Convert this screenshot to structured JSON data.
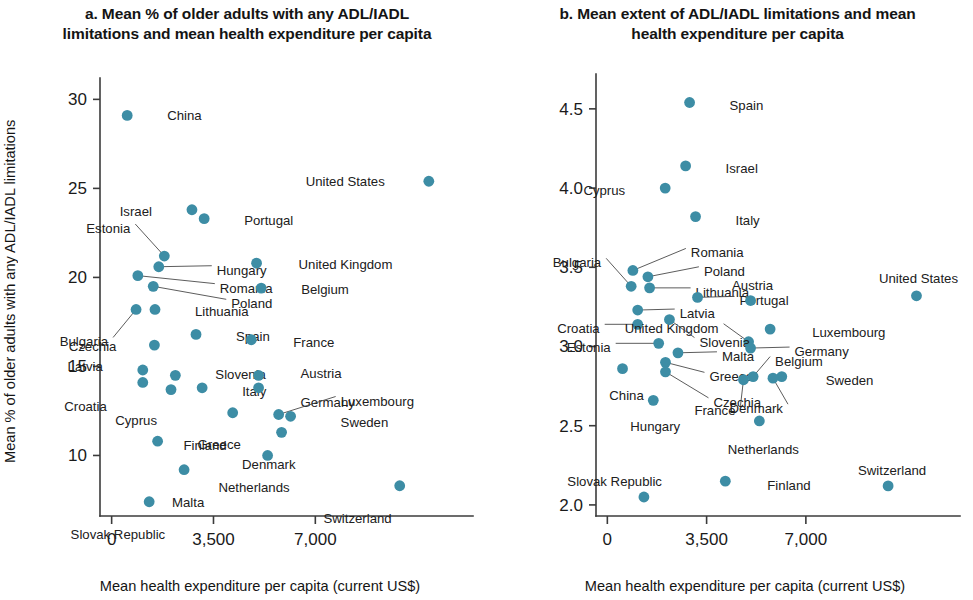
{
  "figure": {
    "background": "#ffffff",
    "marker_color": "#3d8da5",
    "axis_color": "#3b3b3b",
    "text_color": "#1a1a1a"
  },
  "panel_a": {
    "title": "a. Mean % of older adults with any ADL/IADL limitations and mean health expenditure per capita",
    "xlabel": "Mean health expenditure per capita (current US$)",
    "ylabel": "Mean % of older adults with any ADL/IADL limitations"
  },
  "panel_b": {
    "title": "b. Mean extent of ADL/IADL limitations and mean health expenditure per capita",
    "xlabel": "Mean health expenditure per capita (current US$)",
    "ylabel": "Mean extent of ADL/IADL limitations"
  },
  "chart_data": [
    {
      "type": "scatter",
      "panel": "a",
      "title": "a. Mean % of older adults with any ADL/IADL limitations and mean health expenditure per capita",
      "xlabel": "Mean health expenditure per capita (current US$)",
      "ylabel": "Mean % of older adults with any ADL/IADL limitations",
      "xlim": [
        -400,
        11800
      ],
      "ylim": [
        6.6,
        31.2
      ],
      "xticks": [
        0,
        3500,
        7000
      ],
      "xticklabels": [
        "0",
        "3,500",
        "7,000"
      ],
      "yticks": [
        10,
        15,
        20,
        25,
        30
      ],
      "yticklabels": [
        "10",
        "15",
        "20",
        "25",
        "30"
      ],
      "grid": false,
      "legend": "none",
      "points": [
        {
          "label": "China",
          "x": 535,
          "y": 29.1,
          "lx": 40,
          "ly": 0,
          "anchor": "start"
        },
        {
          "label": "United States",
          "x": 10900,
          "y": 25.4,
          "lx": -44,
          "ly": 0,
          "anchor": "end"
        },
        {
          "label": "Israel",
          "x": 2760,
          "y": 23.8,
          "lx": -40,
          "ly": 1,
          "anchor": "end"
        },
        {
          "label": "Portugal",
          "x": 3180,
          "y": 23.3,
          "lx": 40,
          "ly": 1,
          "anchor": "start"
        },
        {
          "label": "Estonia",
          "x": 1810,
          "y": 21.2,
          "lx": -34,
          "ly": -28,
          "anchor": "end",
          "leader": true
        },
        {
          "label": "Hungary",
          "x": 1620,
          "y": 20.6,
          "lx": 58,
          "ly": 3,
          "anchor": "start",
          "leader": true
        },
        {
          "label": "Romania",
          "x": 900,
          "y": 20.1,
          "lx": 82,
          "ly": 12,
          "anchor": "start",
          "leader": true
        },
        {
          "label": "Poland",
          "x": 1430,
          "y": 19.5,
          "lx": 78,
          "ly": 17,
          "anchor": "start",
          "leader": true
        },
        {
          "label": "United Kingdom",
          "x": 4980,
          "y": 20.8,
          "lx": 42,
          "ly": 1,
          "anchor": "start"
        },
        {
          "label": "Belgium",
          "x": 5140,
          "y": 19.4,
          "lx": 40,
          "ly": 1,
          "anchor": "start"
        },
        {
          "label": "Lithuania",
          "x": 1490,
          "y": 18.2,
          "lx": 40,
          "ly": 2,
          "anchor": "start"
        },
        {
          "label": "Bulgaria",
          "x": 840,
          "y": 18.2,
          "lx": -28,
          "ly": 32,
          "anchor": "end",
          "leader": true
        },
        {
          "label": "Czechia",
          "x": 1470,
          "y": 16.2,
          "lx": -38,
          "ly": 1,
          "anchor": "end"
        },
        {
          "label": "Spain",
          "x": 2900,
          "y": 16.8,
          "lx": 40,
          "ly": 2,
          "anchor": "start"
        },
        {
          "label": "France",
          "x": 4800,
          "y": 16.5,
          "lx": 42,
          "ly": 2,
          "anchor": "start"
        },
        {
          "label": "Latvia",
          "x": 1070,
          "y": 14.8,
          "lx": -40,
          "ly": -4,
          "anchor": "end"
        },
        {
          "label": "Croatia",
          "x": 1070,
          "y": 14.1,
          "lx": -36,
          "ly": 24,
          "anchor": "end"
        },
        {
          "label": "Slovenia",
          "x": 2190,
          "y": 14.5,
          "lx": 40,
          "ly": -1,
          "anchor": "start"
        },
        {
          "label": "Cyprus",
          "x": 2040,
          "y": 13.7,
          "lx": -14,
          "ly": 30,
          "anchor": "end"
        },
        {
          "label": "Italy",
          "x": 3110,
          "y": 13.8,
          "lx": 40,
          "ly": 3,
          "anchor": "start"
        },
        {
          "label": "Austria",
          "x": 5050,
          "y": 14.5,
          "lx": 42,
          "ly": -2,
          "anchor": "start"
        },
        {
          "label": "Germany",
          "x": 5050,
          "y": 13.8,
          "lx": 42,
          "ly": 14,
          "anchor": "start"
        },
        {
          "label": "Luxembourg",
          "x": 5740,
          "y": 12.3,
          "lx": 62,
          "ly": -14,
          "anchor": "start",
          "leader": true
        },
        {
          "label": "Sweden",
          "x": 6150,
          "y": 12.2,
          "lx": 50,
          "ly": 6,
          "anchor": "start"
        },
        {
          "label": "Finland",
          "x": 4160,
          "y": 12.4,
          "lx": -6,
          "ly": 32,
          "anchor": "end"
        },
        {
          "label": "Denmark",
          "x": 5840,
          "y": 11.3,
          "lx": 14,
          "ly": 32,
          "anchor": "end"
        },
        {
          "label": "Greece",
          "x": 1580,
          "y": 10.8,
          "lx": 40,
          "ly": 3,
          "anchor": "start"
        },
        {
          "label": "Netherlands",
          "x": 5360,
          "y": 10.0,
          "lx": 22,
          "ly": 32,
          "anchor": "end"
        },
        {
          "label": "Malta",
          "x": 2490,
          "y": 9.2,
          "lx": 4,
          "ly": 32,
          "anchor": "middle"
        },
        {
          "label": "Switzerland",
          "x": 9900,
          "y": 8.3,
          "lx": -8,
          "ly": 32,
          "anchor": "end"
        },
        {
          "label": "Slovak Republic",
          "x": 1290,
          "y": 7.4,
          "lx": 16,
          "ly": 32,
          "anchor": "end"
        }
      ]
    },
    {
      "type": "scatter",
      "panel": "b",
      "title": "b. Mean extent of ADL/IADL limitations and mean health expenditure per capita",
      "xlabel": "Mean health expenditure per capita (current US$)",
      "ylabel": "Mean extent of ADL/IADL limitations",
      "xlim": [
        -400,
        11800
      ],
      "ylim": [
        1.93,
        4.72
      ],
      "xticks": [
        0,
        3500,
        7000
      ],
      "xticklabels": [
        "0",
        "3,500",
        "7,000"
      ],
      "yticks": [
        2.0,
        2.5,
        3.0,
        3.5,
        4.0,
        4.5
      ],
      "yticklabels": [
        "2.0",
        "2.5",
        "3.0",
        "3.5",
        "4.0",
        "4.5"
      ],
      "grid": false,
      "legend": "none",
      "points": [
        {
          "label": "Spain",
          "x": 2900,
          "y": 4.54,
          "lx": 40,
          "ly": 2,
          "anchor": "start"
        },
        {
          "label": "Israel",
          "x": 2760,
          "y": 4.14,
          "lx": 40,
          "ly": 2,
          "anchor": "start"
        },
        {
          "label": "Cyprus",
          "x": 2040,
          "y": 4.0,
          "lx": -40,
          "ly": 2,
          "anchor": "end"
        },
        {
          "label": "Italy",
          "x": 3110,
          "y": 3.82,
          "lx": 40,
          "ly": 3,
          "anchor": "start"
        },
        {
          "label": "Bulgaria",
          "x": 840,
          "y": 3.38,
          "lx": -30,
          "ly": -24,
          "anchor": "end",
          "leader": true
        },
        {
          "label": "Romania",
          "x": 900,
          "y": 3.48,
          "lx": 58,
          "ly": -18,
          "anchor": "start",
          "leader": true
        },
        {
          "label": "Poland",
          "x": 1430,
          "y": 3.44,
          "lx": 56,
          "ly": -6,
          "anchor": "start",
          "leader": true
        },
        {
          "label": "Lithuania",
          "x": 1490,
          "y": 3.37,
          "lx": 46,
          "ly": 4,
          "anchor": "start",
          "leader": true
        },
        {
          "label": "Portugal",
          "x": 3180,
          "y": 3.31,
          "lx": 42,
          "ly": 3,
          "anchor": "start",
          "leader": true
        },
        {
          "label": "Latvia",
          "x": 1070,
          "y": 3.23,
          "lx": 42,
          "ly": 3,
          "anchor": "start",
          "leader": true
        },
        {
          "label": "Austria",
          "x": 5050,
          "y": 3.29,
          "lx": 2,
          "ly": -16,
          "anchor": "middle"
        },
        {
          "label": "United States",
          "x": 10900,
          "y": 3.32,
          "lx": 2,
          "ly": -18,
          "anchor": "middle"
        },
        {
          "label": "Croatia",
          "x": 1070,
          "y": 3.14,
          "lx": -38,
          "ly": 4,
          "anchor": "end",
          "leader": true
        },
        {
          "label": "United Kingdom",
          "x": 4980,
          "y": 3.03,
          "lx": -30,
          "ly": -14,
          "anchor": "end",
          "leader": true
        },
        {
          "label": "Luxembourg",
          "x": 5740,
          "y": 3.11,
          "lx": 42,
          "ly": 3,
          "anchor": "start"
        },
        {
          "label": "Slovenia",
          "x": 2190,
          "y": 3.17,
          "lx": 30,
          "ly": 22,
          "anchor": "start",
          "leader": true
        },
        {
          "label": "Estonia",
          "x": 1810,
          "y": 3.02,
          "lx": -48,
          "ly": 4,
          "anchor": "end",
          "leader": true
        },
        {
          "label": "Malta",
          "x": 2490,
          "y": 2.96,
          "lx": 44,
          "ly": 3,
          "anchor": "start",
          "leader": true
        },
        {
          "label": "Germany",
          "x": 5050,
          "y": 2.99,
          "lx": 44,
          "ly": 3,
          "anchor": "start",
          "leader": true
        },
        {
          "label": "China",
          "x": 535,
          "y": 2.86,
          "lx": 4,
          "ly": 26,
          "anchor": "middle"
        },
        {
          "label": "Greece",
          "x": 2050,
          "y": 2.9,
          "lx": 44,
          "ly": 14,
          "anchor": "start",
          "leader": true
        },
        {
          "label": "Czechia",
          "x": 2050,
          "y": 2.84,
          "lx": 48,
          "ly": 30,
          "anchor": "start",
          "leader": true
        },
        {
          "label": "Belgium",
          "x": 5140,
          "y": 2.81,
          "lx": 22,
          "ly": -16,
          "anchor": "start",
          "leader": true
        },
        {
          "label": "France",
          "x": 4800,
          "y": 2.79,
          "lx": -8,
          "ly": 30,
          "anchor": "end",
          "leader": true
        },
        {
          "label": "Sweden",
          "x": 6150,
          "y": 2.81,
          "lx": 44,
          "ly": 3,
          "anchor": "start"
        },
        {
          "label": "Denmark",
          "x": 5840,
          "y": 2.8,
          "lx": 10,
          "ly": 30,
          "anchor": "end",
          "leader": true
        },
        {
          "label": "Hungary",
          "x": 1620,
          "y": 2.66,
          "lx": 2,
          "ly": 26,
          "anchor": "middle"
        },
        {
          "label": "Netherlands",
          "x": 5360,
          "y": 2.53,
          "lx": 4,
          "ly": 28,
          "anchor": "middle"
        },
        {
          "label": "Switzerland",
          "x": 9900,
          "y": 2.12,
          "lx": 4,
          "ly": -16,
          "anchor": "middle"
        },
        {
          "label": "Finland",
          "x": 4160,
          "y": 2.15,
          "lx": 42,
          "ly": 4,
          "anchor": "start"
        },
        {
          "label": "Slovak Republic",
          "x": 1290,
          "y": 2.05,
          "lx": 18,
          "ly": -16,
          "anchor": "end"
        }
      ]
    }
  ]
}
